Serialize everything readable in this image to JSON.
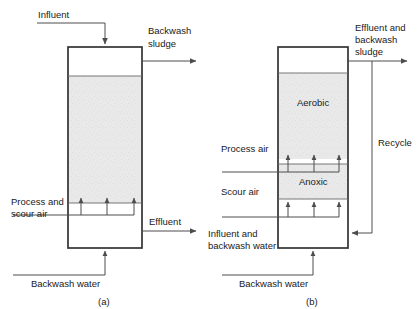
{
  "figure": {
    "background_color": "#ffffff",
    "line_color": "#4d4d4d",
    "box_border_color": "#333333",
    "media_fill_color": "#e8e8e8",
    "text_color": "#1a1a1a"
  },
  "diagram_a": {
    "caption": "(a)",
    "labels": {
      "influent": "Influent",
      "backwash_sludge_line1": "Backwash",
      "backwash_sludge_line2": "sludge",
      "process_scour_air_line1": "Process and",
      "process_scour_air_line2": "scour air",
      "effluent": "Effluent",
      "backwash_water": "Backwash water"
    }
  },
  "diagram_b": {
    "caption": "(b)",
    "labels": {
      "effluent_backwash_sludge_line1": "Effluent and",
      "effluent_backwash_sludge_line2": "backwash",
      "effluent_backwash_sludge_line3": "sludge",
      "recycle": "Recycle",
      "process_air": "Process air",
      "scour_air": "Scour air",
      "aerobic": "Aerobic",
      "anoxic": "Anoxic",
      "influent_backwash_water_line1": "Influent and",
      "influent_backwash_water_line2": "backwash water",
      "backwash_water": "Backwash water"
    }
  }
}
